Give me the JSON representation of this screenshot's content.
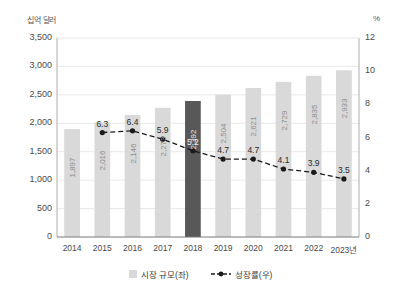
{
  "chart_data": {
    "type": "bar",
    "title": "",
    "subtitle": "",
    "xlabel": "",
    "ylabel": "십억 달러",
    "y2label": "%",
    "categories": [
      "2014",
      "2015",
      "2016",
      "2017",
      "2018",
      "2019",
      "2020",
      "2021",
      "2022",
      "2023년"
    ],
    "ylim": [
      0,
      3500
    ],
    "y2lim": [
      0,
      12
    ],
    "yticks": [
      "0",
      "500",
      "1,000",
      "1,500",
      "2,000",
      "2,500",
      "3,000",
      "3,500"
    ],
    "ytick_values": [
      0,
      500,
      1000,
      1500,
      2000,
      2500,
      3000,
      3500
    ],
    "y2ticks": [
      "0",
      "2",
      "4",
      "6",
      "8",
      "10",
      "12"
    ],
    "y2tick_values": [
      0,
      2,
      4,
      6,
      8,
      10,
      12
    ],
    "grid": true,
    "legend_position": "bottom",
    "series": [
      {
        "name": "시장 규모(좌)",
        "type": "bar",
        "axis": "left",
        "color": "#d9d9d9",
        "highlight_color": "#585858",
        "highlight_index": 4,
        "values": [
          1897,
          2016,
          2146,
          2273,
          2392,
          2504,
          2621,
          2729,
          2835,
          2933
        ],
        "labels": [
          "1,897",
          "2,016",
          "2,146",
          "2,273",
          "2,392",
          "2,504",
          "2,621",
          "2,729",
          "2,835",
          "2,933"
        ]
      },
      {
        "name": "성장률(우)",
        "type": "line",
        "axis": "right",
        "color": "#1a1a1a",
        "dashed": true,
        "marker": "circle",
        "values": [
          null,
          6.3,
          6.4,
          5.9,
          5.2,
          4.7,
          4.7,
          4.1,
          3.9,
          3.5
        ],
        "labels": [
          "",
          "6.3",
          "6.4",
          "5.9",
          "5.2",
          "4.7",
          "4.7",
          "4.1",
          "3.9",
          "3.5"
        ]
      }
    ]
  },
  "legend": {
    "bar_label": "시장 규모(좌)",
    "line_label": "성장률(우)"
  },
  "axes": {
    "left_unit": "십억 달러",
    "right_unit": "%"
  }
}
